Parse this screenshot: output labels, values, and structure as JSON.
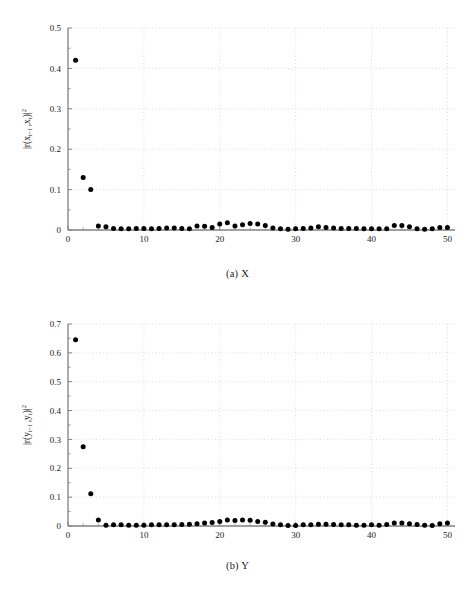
{
  "figure": {
    "background_color": "#ffffff",
    "marker_color": "#000000",
    "axis_color": "#808080",
    "grid_color": "#cccccc",
    "text_color": "#1a1a1a"
  },
  "panel_a": {
    "caption": "(a) X",
    "ylabel_parts": {
      "prefix": "|r(x",
      "sub1": "t−l",
      "mid": " ,x",
      "sub2": "t",
      "suffix": ")|",
      "sup": "2"
    },
    "xlabel": "l"
  },
  "panel_b": {
    "caption": "(b) Y",
    "ylabel_parts": {
      "prefix": "|r(y",
      "sub1": "t−l",
      "mid": " ,y",
      "sub2": "t",
      "suffix": ")|",
      "sup": "2"
    },
    "xlabel": "l"
  },
  "chart_data": [
    {
      "type": "scatter",
      "panel": "a",
      "title": "(a) X",
      "xlabel": "l",
      "ylabel": "|r(x_{t-l}, x_t)|^2",
      "xlim": [
        0,
        51
      ],
      "ylim": [
        0,
        0.5
      ],
      "xticks": [
        0,
        10,
        20,
        30,
        40,
        50
      ],
      "xtick_labels": [
        "0",
        "10",
        "20",
        "30",
        "40",
        "50"
      ],
      "yticks": [
        0,
        0.1,
        0.2,
        0.3,
        0.4,
        0.5
      ],
      "ytick_labels": [
        "0",
        "0.1",
        "0.2",
        "0.3",
        "0.4",
        "0.5"
      ],
      "xminor_step": 2,
      "grid": true,
      "legend": null,
      "x": [
        1,
        2,
        3,
        4,
        5,
        6,
        7,
        8,
        9,
        10,
        11,
        12,
        13,
        14,
        15,
        16,
        17,
        18,
        19,
        20,
        21,
        22,
        23,
        24,
        25,
        26,
        27,
        28,
        29,
        30,
        31,
        32,
        33,
        34,
        35,
        36,
        37,
        38,
        39,
        40,
        41,
        42,
        43,
        44,
        45,
        46,
        47,
        48,
        49,
        50
      ],
      "values": [
        0.42,
        0.13,
        0.1,
        0.01,
        0.008,
        0.004,
        0.003,
        0.003,
        0.004,
        0.004,
        0.003,
        0.004,
        0.005,
        0.005,
        0.004,
        0.003,
        0.01,
        0.009,
        0.006,
        0.015,
        0.018,
        0.01,
        0.013,
        0.016,
        0.015,
        0.011,
        0.005,
        0.003,
        0.002,
        0.003,
        0.004,
        0.005,
        0.008,
        0.006,
        0.005,
        0.004,
        0.004,
        0.004,
        0.003,
        0.003,
        0.003,
        0.003,
        0.011,
        0.011,
        0.008,
        0.003,
        0.002,
        0.003,
        0.006,
        0.006
      ]
    },
    {
      "type": "scatter",
      "panel": "b",
      "title": "(b) Y",
      "xlabel": "l",
      "ylabel": "|r(y_{t-l}, y_t)|^2",
      "xlim": [
        0,
        51
      ],
      "ylim": [
        0,
        0.7
      ],
      "xticks": [
        0,
        10,
        20,
        30,
        40,
        50
      ],
      "xtick_labels": [
        "0",
        "10",
        "20",
        "30",
        "40",
        "50"
      ],
      "yticks": [
        0,
        0.1,
        0.2,
        0.3,
        0.4,
        0.5,
        0.6,
        0.7
      ],
      "ytick_labels": [
        "0",
        "0.1",
        "0.2",
        "0.3",
        "0.4",
        "0.5",
        "0.6",
        "0.7"
      ],
      "xminor_step": 2,
      "grid": true,
      "legend": null,
      "x": [
        1,
        2,
        3,
        4,
        5,
        6,
        7,
        8,
        9,
        10,
        11,
        12,
        13,
        14,
        15,
        16,
        17,
        18,
        19,
        20,
        21,
        22,
        23,
        24,
        25,
        26,
        27,
        28,
        29,
        30,
        31,
        32,
        33,
        34,
        35,
        36,
        37,
        38,
        39,
        40,
        41,
        42,
        43,
        44,
        45,
        46,
        47,
        48,
        49,
        50
      ],
      "values": [
        0.645,
        0.275,
        0.112,
        0.021,
        0.003,
        0.004,
        0.004,
        0.003,
        0.003,
        0.003,
        0.004,
        0.004,
        0.004,
        0.004,
        0.005,
        0.006,
        0.008,
        0.01,
        0.012,
        0.016,
        0.021,
        0.019,
        0.021,
        0.02,
        0.016,
        0.013,
        0.007,
        0.004,
        0.002,
        0.002,
        0.004,
        0.004,
        0.006,
        0.006,
        0.005,
        0.004,
        0.004,
        0.003,
        0.003,
        0.004,
        0.003,
        0.005,
        0.01,
        0.01,
        0.008,
        0.005,
        0.003,
        0.002,
        0.008,
        0.01
      ]
    }
  ]
}
